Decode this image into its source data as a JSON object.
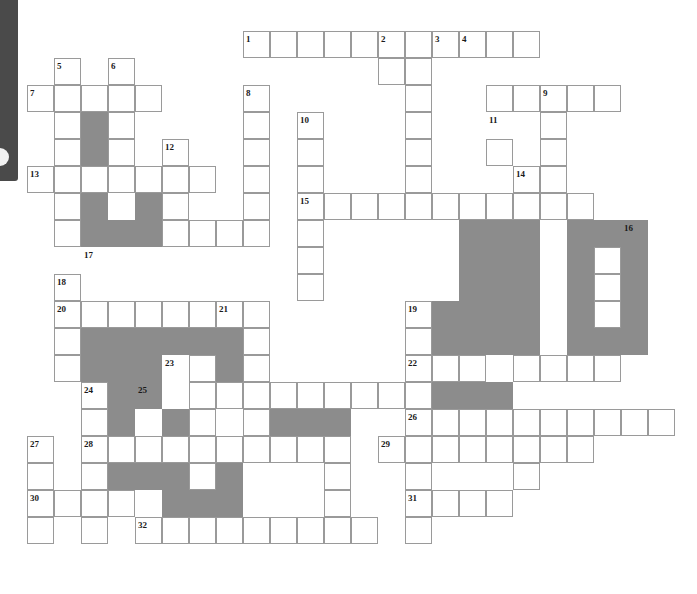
{
  "page": {
    "width": 697,
    "height": 594
  },
  "sidebar": {
    "name": "left-edge-panel",
    "color": "#4a4a4a",
    "knob_color": "#f2f2f2"
  },
  "grid": {
    "cell_size": 27,
    "origin_x": 27,
    "origin_y": 31,
    "line_color": "#9a9a9a",
    "blocked_color": "#8c8c8c",
    "cell_color": "#ffffff",
    "columns": 25,
    "rows": 21
  },
  "chart_data": {
    "type": "table",
    "open_cells": [
      [
        8,
        0
      ],
      [
        9,
        0
      ],
      [
        10,
        0
      ],
      [
        11,
        0
      ],
      [
        12,
        0
      ],
      [
        13,
        0
      ],
      [
        14,
        0
      ],
      [
        15,
        0
      ],
      [
        16,
        0
      ],
      [
        17,
        0
      ],
      [
        18,
        0
      ],
      [
        1,
        1
      ],
      [
        3,
        1
      ],
      [
        13,
        1
      ],
      [
        14,
        1
      ],
      [
        0,
        2
      ],
      [
        1,
        2
      ],
      [
        2,
        2
      ],
      [
        3,
        2
      ],
      [
        4,
        2
      ],
      [
        8,
        2
      ],
      [
        14,
        2
      ],
      [
        17,
        2
      ],
      [
        18,
        2
      ],
      [
        19,
        2
      ],
      [
        20,
        2
      ],
      [
        21,
        2
      ],
      [
        1,
        3
      ],
      [
        3,
        3
      ],
      [
        8,
        3
      ],
      [
        10,
        3
      ],
      [
        14,
        3
      ],
      [
        19,
        3
      ],
      [
        1,
        4
      ],
      [
        3,
        4
      ],
      [
        5,
        4
      ],
      [
        8,
        4
      ],
      [
        10,
        4
      ],
      [
        14,
        4
      ],
      [
        17,
        4
      ],
      [
        19,
        4
      ],
      [
        0,
        5
      ],
      [
        1,
        5
      ],
      [
        2,
        5
      ],
      [
        3,
        5
      ],
      [
        4,
        5
      ],
      [
        5,
        5
      ],
      [
        6,
        5
      ],
      [
        8,
        5
      ],
      [
        10,
        5
      ],
      [
        14,
        5
      ],
      [
        18,
        5
      ],
      [
        19,
        5
      ],
      [
        1,
        6
      ],
      [
        4,
        6
      ],
      [
        5,
        6
      ],
      [
        8,
        6
      ],
      [
        10,
        6
      ],
      [
        11,
        6
      ],
      [
        12,
        6
      ],
      [
        13,
        6
      ],
      [
        14,
        6
      ],
      [
        15,
        6
      ],
      [
        16,
        6
      ],
      [
        17,
        6
      ],
      [
        18,
        6
      ],
      [
        19,
        6
      ],
      [
        20,
        6
      ],
      [
        1,
        7
      ],
      [
        5,
        7
      ],
      [
        8,
        7
      ],
      [
        10,
        7
      ],
      [
        16,
        7
      ],
      [
        18,
        7
      ],
      [
        21,
        7
      ],
      [
        2,
        7
      ],
      [
        3,
        7
      ],
      [
        4,
        7
      ],
      [
        5,
        7
      ],
      [
        6,
        7
      ],
      [
        7,
        7
      ],
      [
        8,
        7
      ],
      [
        10,
        8
      ],
      [
        16,
        8
      ],
      [
        18,
        8
      ],
      [
        21,
        8
      ],
      [
        1,
        9
      ],
      [
        10,
        9
      ],
      [
        16,
        9
      ],
      [
        18,
        9
      ],
      [
        21,
        9
      ],
      [
        1,
        10
      ],
      [
        2,
        10
      ],
      [
        3,
        10
      ],
      [
        4,
        10
      ],
      [
        5,
        10
      ],
      [
        6,
        10
      ],
      [
        7,
        10
      ],
      [
        8,
        10
      ],
      [
        14,
        10
      ],
      [
        16,
        10
      ],
      [
        18,
        10
      ],
      [
        21,
        10
      ],
      [
        1,
        11
      ],
      [
        8,
        11
      ],
      [
        14,
        11
      ],
      [
        16,
        11
      ],
      [
        18,
        11
      ],
      [
        21,
        11
      ],
      [
        1,
        12
      ],
      [
        6,
        12
      ],
      [
        8,
        12
      ],
      [
        14,
        12
      ],
      [
        15,
        12
      ],
      [
        16,
        12
      ],
      [
        18,
        12
      ],
      [
        19,
        12
      ],
      [
        20,
        12
      ],
      [
        21,
        12
      ],
      [
        2,
        13
      ],
      [
        3,
        13
      ],
      [
        6,
        13
      ],
      [
        7,
        13
      ],
      [
        8,
        13
      ],
      [
        9,
        13
      ],
      [
        10,
        13
      ],
      [
        11,
        13
      ],
      [
        12,
        13
      ],
      [
        13,
        13
      ],
      [
        14,
        13
      ],
      [
        2,
        14
      ],
      [
        6,
        14
      ],
      [
        8,
        14
      ],
      [
        11,
        14
      ],
      [
        14,
        14
      ],
      [
        15,
        14
      ],
      [
        16,
        14
      ],
      [
        17,
        14
      ],
      [
        18,
        14
      ],
      [
        19,
        14
      ],
      [
        20,
        14
      ],
      [
        21,
        14
      ],
      [
        22,
        14
      ],
      [
        23,
        14
      ],
      [
        0,
        15
      ],
      [
        2,
        15
      ],
      [
        3,
        15
      ],
      [
        4,
        15
      ],
      [
        5,
        15
      ],
      [
        6,
        15
      ],
      [
        7,
        15
      ],
      [
        8,
        15
      ],
      [
        9,
        15
      ],
      [
        10,
        15
      ],
      [
        11,
        15
      ],
      [
        13,
        15
      ],
      [
        14,
        15
      ],
      [
        15,
        15
      ],
      [
        16,
        15
      ],
      [
        17,
        15
      ],
      [
        18,
        15
      ],
      [
        19,
        15
      ],
      [
        20,
        15
      ],
      [
        0,
        16
      ],
      [
        2,
        16
      ],
      [
        6,
        16
      ],
      [
        11,
        16
      ],
      [
        14,
        16
      ],
      [
        18,
        16
      ],
      [
        0,
        17
      ],
      [
        1,
        17
      ],
      [
        2,
        17
      ],
      [
        3,
        17
      ],
      [
        11,
        17
      ],
      [
        14,
        17
      ],
      [
        15,
        17
      ],
      [
        16,
        17
      ],
      [
        17,
        17
      ],
      [
        0,
        18
      ],
      [
        2,
        18
      ],
      [
        4,
        18
      ],
      [
        5,
        18
      ],
      [
        6,
        18
      ],
      [
        7,
        18
      ],
      [
        8,
        18
      ],
      [
        9,
        18
      ],
      [
        10,
        18
      ],
      [
        11,
        18
      ],
      [
        12,
        18
      ],
      [
        14,
        18
      ]
    ],
    "blocked_cells": [
      [
        2,
        3
      ],
      [
        2,
        4
      ],
      [
        2,
        6
      ],
      [
        4,
        6
      ],
      [
        2,
        7
      ],
      [
        3,
        7
      ],
      [
        4,
        7
      ],
      [
        16,
        7
      ],
      [
        17,
        7
      ],
      [
        18,
        7
      ],
      [
        20,
        7
      ],
      [
        21,
        7
      ],
      [
        22,
        7
      ],
      [
        16,
        8
      ],
      [
        17,
        8
      ],
      [
        18,
        8
      ],
      [
        20,
        8
      ],
      [
        22,
        8
      ],
      [
        16,
        9
      ],
      [
        17,
        9
      ],
      [
        18,
        9
      ],
      [
        20,
        9
      ],
      [
        22,
        9
      ],
      [
        15,
        10
      ],
      [
        16,
        10
      ],
      [
        17,
        10
      ],
      [
        18,
        10
      ],
      [
        20,
        10
      ],
      [
        22,
        10
      ],
      [
        15,
        11
      ],
      [
        16,
        11
      ],
      [
        17,
        11
      ],
      [
        18,
        11
      ],
      [
        20,
        11
      ],
      [
        21,
        11
      ],
      [
        22,
        11
      ],
      [
        15,
        13
      ],
      [
        16,
        13
      ],
      [
        17,
        13
      ],
      [
        2,
        11
      ],
      [
        3,
        11
      ],
      [
        4,
        11
      ],
      [
        5,
        11
      ],
      [
        6,
        11
      ],
      [
        7,
        11
      ],
      [
        2,
        12
      ],
      [
        3,
        12
      ],
      [
        4,
        12
      ],
      [
        7,
        12
      ],
      [
        3,
        13
      ],
      [
        4,
        13
      ],
      [
        3,
        14
      ],
      [
        5,
        14
      ],
      [
        9,
        14
      ],
      [
        10,
        14
      ],
      [
        11,
        14
      ],
      [
        3,
        16
      ],
      [
        4,
        16
      ],
      [
        5,
        16
      ],
      [
        7,
        16
      ],
      [
        5,
        17
      ],
      [
        6,
        17
      ],
      [
        7,
        17
      ]
    ],
    "numbered_cells": [
      {
        "n": 1,
        "col": 8,
        "row": 0
      },
      {
        "n": 2,
        "col": 13,
        "row": 0
      },
      {
        "n": 3,
        "col": 15,
        "row": 0
      },
      {
        "n": 4,
        "col": 16,
        "row": 0
      },
      {
        "n": 5,
        "col": 1,
        "row": 1
      },
      {
        "n": 6,
        "col": 3,
        "row": 1
      },
      {
        "n": 7,
        "col": 0,
        "row": 2
      },
      {
        "n": 8,
        "col": 8,
        "row": 2
      },
      {
        "n": 9,
        "col": 19,
        "row": 2
      },
      {
        "n": 10,
        "col": 10,
        "row": 3
      },
      {
        "n": 11,
        "col": 17,
        "row": 3
      },
      {
        "n": 12,
        "col": 5,
        "row": 4
      },
      {
        "n": 13,
        "col": 0,
        "row": 5
      },
      {
        "n": 14,
        "col": 18,
        "row": 5
      },
      {
        "n": 15,
        "col": 10,
        "row": 6
      },
      {
        "n": 16,
        "col": 22,
        "row": 7
      },
      {
        "n": 17,
        "col": 2,
        "row": 8
      },
      {
        "n": 18,
        "col": 1,
        "row": 9
      },
      {
        "n": 19,
        "col": 14,
        "row": 10
      },
      {
        "n": 20,
        "col": 1,
        "row": 10
      },
      {
        "n": 21,
        "col": 7,
        "row": 10
      },
      {
        "n": 22,
        "col": 14,
        "row": 12
      },
      {
        "n": 23,
        "col": 5,
        "row": 12
      },
      {
        "n": 24,
        "col": 2,
        "row": 13
      },
      {
        "n": 25,
        "col": 4,
        "row": 13
      },
      {
        "n": 26,
        "col": 14,
        "row": 14
      },
      {
        "n": 27,
        "col": 0,
        "row": 15
      },
      {
        "n": 28,
        "col": 2,
        "row": 15
      },
      {
        "n": 29,
        "col": 13,
        "row": 15
      },
      {
        "n": 30,
        "col": 0,
        "row": 17
      },
      {
        "n": 31,
        "col": 14,
        "row": 17
      },
      {
        "n": 32,
        "col": 4,
        "row": 18
      }
    ]
  }
}
